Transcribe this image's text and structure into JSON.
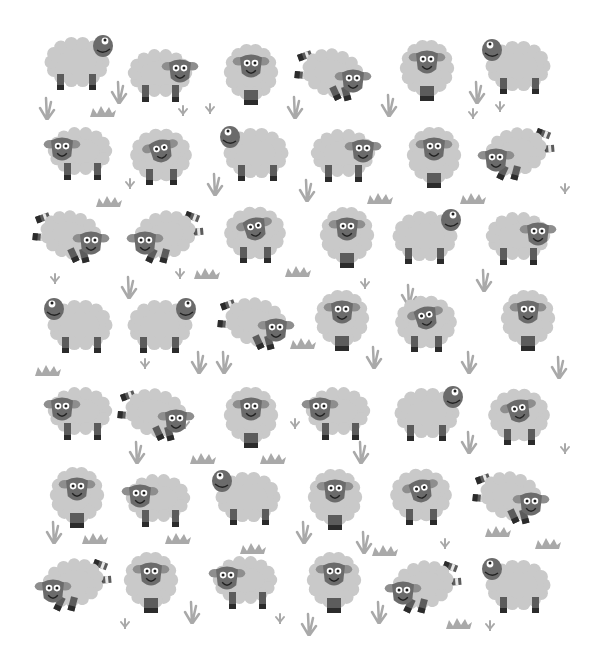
{
  "illustration": {
    "title": "",
    "subject": "Pattern of cartoon sheep on white background",
    "colors": {
      "background": "#ffffff",
      "wool": "#c9c9c9",
      "face": "#6b6b6b",
      "ear": "#8e8e8e",
      "leg": "#5c5c5c",
      "hoof": "#2b2b2b",
      "stripe": "#e8e8e8",
      "eye_white": "#ffffff",
      "pupil": "#1e1e1e",
      "mouth": "#222222",
      "grass": "#a9a9a9"
    },
    "sheep": [
      {
        "row": 0,
        "x": 45,
        "y": 32,
        "pose": "look-up-right"
      },
      {
        "row": 0,
        "x": 128,
        "y": 45,
        "pose": "side-right"
      },
      {
        "row": 0,
        "x": 222,
        "y": 42,
        "pose": "front"
      },
      {
        "row": 0,
        "x": 295,
        "y": 43,
        "pose": "jump-right"
      },
      {
        "row": 0,
        "x": 398,
        "y": 38,
        "pose": "front"
      },
      {
        "row": 0,
        "x": 478,
        "y": 36,
        "pose": "look-up-left"
      },
      {
        "row": 1,
        "x": 40,
        "y": 123,
        "pose": "side-left"
      },
      {
        "row": 1,
        "x": 128,
        "y": 125,
        "pose": "front-tilt"
      },
      {
        "row": 1,
        "x": 216,
        "y": 123,
        "pose": "look-up-left"
      },
      {
        "row": 1,
        "x": 311,
        "y": 125,
        "pose": "side-right"
      },
      {
        "row": 1,
        "x": 405,
        "y": 125,
        "pose": "front"
      },
      {
        "row": 1,
        "x": 476,
        "y": 122,
        "pose": "jump-left"
      },
      {
        "row": 2,
        "x": 33,
        "y": 205,
        "pose": "jump-right"
      },
      {
        "row": 2,
        "x": 125,
        "y": 205,
        "pose": "jump-left"
      },
      {
        "row": 2,
        "x": 222,
        "y": 203,
        "pose": "front-tilt"
      },
      {
        "row": 2,
        "x": 318,
        "y": 205,
        "pose": "front"
      },
      {
        "row": 2,
        "x": 393,
        "y": 206,
        "pose": "look-up-right"
      },
      {
        "row": 2,
        "x": 486,
        "y": 208,
        "pose": "side-right"
      },
      {
        "row": 3,
        "x": 40,
        "y": 295,
        "pose": "look-up-left"
      },
      {
        "row": 3,
        "x": 128,
        "y": 295,
        "pose": "look-up-right"
      },
      {
        "row": 3,
        "x": 218,
        "y": 292,
        "pose": "jump-right"
      },
      {
        "row": 3,
        "x": 313,
        "y": 288,
        "pose": "front"
      },
      {
        "row": 3,
        "x": 393,
        "y": 292,
        "pose": "front-tilt"
      },
      {
        "row": 3,
        "x": 499,
        "y": 288,
        "pose": "front"
      },
      {
        "row": 4,
        "x": 40,
        "y": 383,
        "pose": "side-left"
      },
      {
        "row": 4,
        "x": 118,
        "y": 383,
        "pose": "jump-right"
      },
      {
        "row": 4,
        "x": 222,
        "y": 385,
        "pose": "front"
      },
      {
        "row": 4,
        "x": 298,
        "y": 383,
        "pose": "side-left"
      },
      {
        "row": 4,
        "x": 395,
        "y": 383,
        "pose": "look-up-right"
      },
      {
        "row": 4,
        "x": 486,
        "y": 385,
        "pose": "front-tilt"
      },
      {
        "row": 5,
        "x": 48,
        "y": 465,
        "pose": "front"
      },
      {
        "row": 5,
        "x": 118,
        "y": 470,
        "pose": "side-left"
      },
      {
        "row": 5,
        "x": 208,
        "y": 467,
        "pose": "look-up-left"
      },
      {
        "row": 5,
        "x": 306,
        "y": 467,
        "pose": "front"
      },
      {
        "row": 5,
        "x": 388,
        "y": 465,
        "pose": "front-tilt"
      },
      {
        "row": 5,
        "x": 473,
        "y": 466,
        "pose": "jump-right"
      },
      {
        "row": 6,
        "x": 33,
        "y": 553,
        "pose": "jump-left"
      },
      {
        "row": 6,
        "x": 122,
        "y": 550,
        "pose": "front"
      },
      {
        "row": 6,
        "x": 205,
        "y": 552,
        "pose": "side-left"
      },
      {
        "row": 6,
        "x": 305,
        "y": 550,
        "pose": "front"
      },
      {
        "row": 6,
        "x": 383,
        "y": 555,
        "pose": "jump-left"
      },
      {
        "row": 6,
        "x": 478,
        "y": 555,
        "pose": "look-up-left"
      }
    ],
    "grass": [
      {
        "x": 38,
        "y": 96,
        "type": "tuft"
      },
      {
        "x": 90,
        "y": 103,
        "type": "zigzag"
      },
      {
        "x": 110,
        "y": 80,
        "type": "tuft"
      },
      {
        "x": 178,
        "y": 102,
        "type": "sprig"
      },
      {
        "x": 205,
        "y": 100,
        "type": "sprig"
      },
      {
        "x": 286,
        "y": 95,
        "type": "tuft"
      },
      {
        "x": 380,
        "y": 93,
        "type": "tuft"
      },
      {
        "x": 468,
        "y": 80,
        "type": "tuft"
      },
      {
        "x": 468,
        "y": 105,
        "type": "sprig"
      },
      {
        "x": 495,
        "y": 98,
        "type": "sprig"
      },
      {
        "x": 125,
        "y": 175,
        "type": "sprig"
      },
      {
        "x": 206,
        "y": 172,
        "type": "tuft"
      },
      {
        "x": 298,
        "y": 178,
        "type": "tuft"
      },
      {
        "x": 367,
        "y": 190,
        "type": "zigzag"
      },
      {
        "x": 460,
        "y": 190,
        "type": "zigzag"
      },
      {
        "x": 560,
        "y": 180,
        "type": "sprig"
      },
      {
        "x": 96,
        "y": 193,
        "type": "zigzag"
      },
      {
        "x": 50,
        "y": 270,
        "type": "sprig"
      },
      {
        "x": 120,
        "y": 275,
        "type": "tuft"
      },
      {
        "x": 175,
        "y": 265,
        "type": "sprig"
      },
      {
        "x": 194,
        "y": 265,
        "type": "zigzag"
      },
      {
        "x": 285,
        "y": 263,
        "type": "zigzag"
      },
      {
        "x": 360,
        "y": 275,
        "type": "sprig"
      },
      {
        "x": 400,
        "y": 283,
        "type": "tuft"
      },
      {
        "x": 475,
        "y": 268,
        "type": "tuft"
      },
      {
        "x": 35,
        "y": 362,
        "type": "zigzag"
      },
      {
        "x": 140,
        "y": 355,
        "type": "sprig"
      },
      {
        "x": 190,
        "y": 350,
        "type": "tuft"
      },
      {
        "x": 215,
        "y": 350,
        "type": "tuft"
      },
      {
        "x": 290,
        "y": 335,
        "type": "zigzag"
      },
      {
        "x": 365,
        "y": 345,
        "type": "tuft"
      },
      {
        "x": 460,
        "y": 350,
        "type": "tuft"
      },
      {
        "x": 550,
        "y": 355,
        "type": "tuft"
      },
      {
        "x": 128,
        "y": 440,
        "type": "tuft"
      },
      {
        "x": 180,
        "y": 415,
        "type": "sprig"
      },
      {
        "x": 190,
        "y": 450,
        "type": "zigzag"
      },
      {
        "x": 260,
        "y": 450,
        "type": "zigzag"
      },
      {
        "x": 290,
        "y": 415,
        "type": "sprig"
      },
      {
        "x": 352,
        "y": 440,
        "type": "tuft"
      },
      {
        "x": 460,
        "y": 430,
        "type": "tuft"
      },
      {
        "x": 560,
        "y": 440,
        "type": "sprig"
      },
      {
        "x": 45,
        "y": 520,
        "type": "tuft"
      },
      {
        "x": 82,
        "y": 530,
        "type": "zigzag"
      },
      {
        "x": 165,
        "y": 530,
        "type": "zigzag"
      },
      {
        "x": 240,
        "y": 540,
        "type": "zigzag"
      },
      {
        "x": 295,
        "y": 520,
        "type": "tuft"
      },
      {
        "x": 355,
        "y": 530,
        "type": "tuft"
      },
      {
        "x": 372,
        "y": 542,
        "type": "zigzag"
      },
      {
        "x": 440,
        "y": 535,
        "type": "sprig"
      },
      {
        "x": 485,
        "y": 523,
        "type": "zigzag"
      },
      {
        "x": 535,
        "y": 535,
        "type": "zigzag"
      },
      {
        "x": 120,
        "y": 615,
        "type": "sprig"
      },
      {
        "x": 183,
        "y": 600,
        "type": "tuft"
      },
      {
        "x": 275,
        "y": 610,
        "type": "sprig"
      },
      {
        "x": 300,
        "y": 612,
        "type": "tuft"
      },
      {
        "x": 370,
        "y": 600,
        "type": "tuft"
      },
      {
        "x": 446,
        "y": 615,
        "type": "zigzag"
      },
      {
        "x": 485,
        "y": 617,
        "type": "sprig"
      }
    ]
  }
}
